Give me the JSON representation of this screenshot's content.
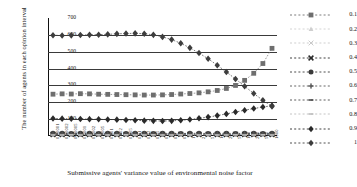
{
  "chart_data": {
    "type": "line",
    "title": "",
    "xlabel": "Submissive agents' variance value of environmental noise factor",
    "ylabel": "The number of agents in each opinion interval",
    "ylim": [
      0,
      700
    ],
    "yticks": [
      0,
      100,
      200,
      300,
      400,
      500,
      600,
      700
    ],
    "grid": true,
    "legend_position": "right",
    "x": [
      "0.00001",
      "0.00002",
      "0.00005",
      "0.0001",
      "0.0002",
      "0.0005",
      "0.001",
      "0.002",
      "0.005",
      "0.01",
      "0.02",
      "0.05",
      "0.1",
      "0.2",
      "0.5",
      "1",
      "2",
      "5",
      "10",
      "20",
      "50",
      "100",
      "200",
      "500",
      "1000"
    ],
    "series": [
      {
        "name": "0.1",
        "marker": "square",
        "color": "#6e6e6e",
        "values": [
          248,
          250,
          249,
          251,
          250,
          248,
          247,
          246,
          245,
          244,
          243,
          243,
          244,
          246,
          249,
          252,
          256,
          262,
          270,
          282,
          300,
          330,
          372,
          430,
          520
        ]
      },
      {
        "name": "0.2",
        "marker": "triangle",
        "color": "#cfcfcf",
        "values": [
          14,
          14,
          13,
          13,
          14,
          14,
          13,
          13,
          14,
          14,
          13,
          13,
          14,
          14,
          13,
          14,
          14,
          13,
          14,
          14,
          13,
          14,
          14,
          13,
          14
        ]
      },
      {
        "name": "0.3",
        "marker": "x-light",
        "color": "#c9c9c9",
        "values": [
          11,
          11,
          12,
          11,
          11,
          12,
          11,
          11,
          12,
          11,
          11,
          12,
          11,
          11,
          12,
          11,
          11,
          12,
          11,
          11,
          12,
          11,
          11,
          12,
          11
        ]
      },
      {
        "name": "0.4",
        "marker": "x-bold",
        "color": "#2b2b2b",
        "values": [
          9,
          9,
          10,
          9,
          9,
          10,
          9,
          9,
          10,
          9,
          9,
          10,
          9,
          9,
          10,
          9,
          9,
          10,
          9,
          9,
          10,
          9,
          9,
          10,
          9
        ]
      },
      {
        "name": "0.5",
        "marker": "circle",
        "color": "#3a3a3a",
        "values": [
          16,
          16,
          15,
          16,
          16,
          15,
          16,
          16,
          15,
          16,
          16,
          15,
          16,
          16,
          15,
          16,
          16,
          15,
          16,
          16,
          15,
          16,
          16,
          15,
          16
        ]
      },
      {
        "name": "0.6",
        "marker": "plus",
        "color": "#555555",
        "values": [
          12,
          12,
          13,
          12,
          12,
          13,
          12,
          12,
          13,
          12,
          12,
          13,
          12,
          12,
          13,
          12,
          12,
          13,
          12,
          12,
          13,
          12,
          12,
          13,
          12
        ]
      },
      {
        "name": "0.7",
        "marker": "dash",
        "color": "#4a4a4a",
        "values": [
          8,
          8,
          9,
          8,
          8,
          9,
          8,
          8,
          9,
          8,
          8,
          9,
          8,
          8,
          9,
          8,
          8,
          9,
          8,
          8,
          9,
          8,
          8,
          9,
          8
        ]
      },
      {
        "name": "0.8",
        "marker": "dash-light",
        "color": "#bdbdbd",
        "values": [
          6,
          6,
          7,
          6,
          6,
          7,
          6,
          6,
          7,
          6,
          6,
          7,
          6,
          6,
          7,
          6,
          6,
          7,
          6,
          6,
          7,
          6,
          6,
          7,
          6
        ]
      },
      {
        "name": "0.9",
        "marker": "diamond",
        "color": "#2a2a2a",
        "values": [
          104,
          103,
          102,
          101,
          100,
          99,
          98,
          97,
          95,
          93,
          91,
          90,
          89,
          90,
          93,
          98,
          105,
          112,
          121,
          131,
          142,
          153,
          163,
          172,
          180
        ]
      },
      {
        "name": "1",
        "marker": "diamond",
        "color": "#3d3d3d",
        "values": [
          598,
          596,
          597,
          599,
          600,
          601,
          603,
          606,
          608,
          609,
          607,
          600,
          588,
          572,
          550,
          523,
          492,
          458,
          420,
          380,
          338,
          295,
          252,
          212,
          175
        ]
      }
    ]
  }
}
